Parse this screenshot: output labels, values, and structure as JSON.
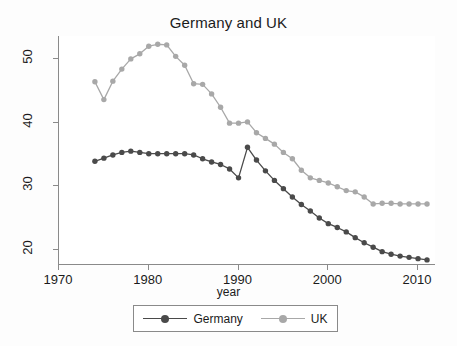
{
  "chart_data": {
    "type": "line",
    "title": "Germany and UK",
    "xlabel": "year",
    "ylabel": "",
    "xlim": [
      1970,
      2012
    ],
    "ylim": [
      17.5,
      53.5
    ],
    "xticks": [
      1970,
      1980,
      1990,
      2000,
      2010
    ],
    "yticks": [
      20,
      30,
      40,
      50
    ],
    "grid": false,
    "legend_position": "bottom",
    "x": [
      1974,
      1975,
      1976,
      1977,
      1978,
      1979,
      1980,
      1981,
      1982,
      1983,
      1984,
      1985,
      1986,
      1987,
      1988,
      1989,
      1990,
      1991,
      1992,
      1993,
      1994,
      1995,
      1996,
      1997,
      1998,
      1999,
      2000,
      2001,
      2002,
      2003,
      2004,
      2005,
      2006,
      2007,
      2008,
      2009,
      2010,
      2011
    ],
    "series": [
      {
        "name": "Germany",
        "color": "#4a4a4a",
        "values": [
          33.8,
          34.3,
          34.8,
          35.2,
          35.4,
          35.2,
          35.0,
          35.0,
          35.0,
          35.0,
          35.0,
          34.8,
          34.2,
          33.7,
          33.3,
          32.6,
          31.2,
          36.0,
          34.0,
          32.3,
          30.8,
          29.5,
          28.2,
          27.0,
          26.0,
          24.9,
          24.0,
          23.4,
          22.7,
          21.8,
          21.0,
          20.3,
          19.6,
          19.2,
          18.9,
          18.7,
          18.5,
          18.3
        ]
      },
      {
        "name": "UK",
        "color": "#a8a8a8",
        "values": [
          46.3,
          43.5,
          46.4,
          48.3,
          49.9,
          50.7,
          51.9,
          52.2,
          52.1,
          50.3,
          48.9,
          46.0,
          45.9,
          44.4,
          42.3,
          39.8,
          39.8,
          40.0,
          38.3,
          37.4,
          36.5,
          35.2,
          34.2,
          32.4,
          31.2,
          30.8,
          30.4,
          29.8,
          29.2,
          29.0,
          28.2,
          27.1,
          27.2,
          27.2,
          27.1,
          27.1,
          27.1,
          27.1
        ]
      }
    ]
  },
  "legend": {
    "entries": [
      {
        "label": "Germany"
      },
      {
        "label": "UK"
      }
    ]
  },
  "axis": {
    "x_title": "year",
    "x_tick_labels": [
      "1970",
      "1980",
      "1990",
      "2000",
      "2010"
    ],
    "y_tick_labels": [
      "20",
      "30",
      "40",
      "50"
    ]
  }
}
